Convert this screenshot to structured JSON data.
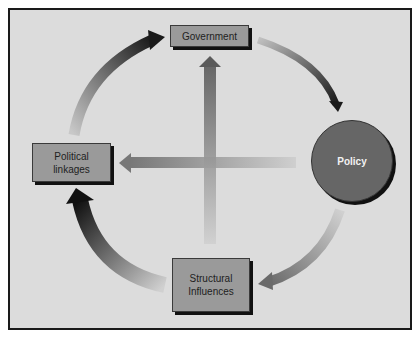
{
  "diagram": {
    "nodes": {
      "government": {
        "label": "Government"
      },
      "policy": {
        "label": "Policy"
      },
      "structural": {
        "line1": "Structural",
        "line2": "Influences"
      },
      "political": {
        "line1": "Political",
        "line2": "linkages"
      }
    },
    "edges": [
      {
        "from": "Political linkages",
        "to": "Government"
      },
      {
        "from": "Government",
        "to": "Policy"
      },
      {
        "from": "Policy",
        "to": "Structural Influences"
      },
      {
        "from": "Structural Influences",
        "to": "Political linkages"
      },
      {
        "from": "Policy",
        "to": "Political linkages"
      },
      {
        "from": "Structural Influences",
        "to": "Government"
      }
    ],
    "colors": {
      "background": "#dcdcdc",
      "box_fill": "#9a9a9a",
      "circle_fill": "#666666",
      "arrow_dark": "#1a1a1a"
    }
  }
}
